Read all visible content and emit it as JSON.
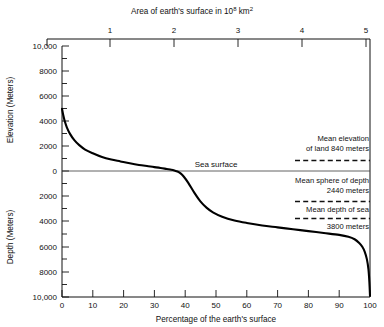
{
  "figure": {
    "caption_top": "Area of earth's surface in 10 8  km 2",
    "background": "#ffffff",
    "curve_color": "#000000"
  },
  "chart_data": {
    "type": "line",
    "title": "",
    "top_axis_label": "Area of earth's surface in 10⁸ km²",
    "top_axis_label_parts": {
      "prefix": "Area of earth's surface in 10",
      "superscript_1": "8",
      "middle": " km",
      "superscript_2": "2"
    },
    "xlabel": "Percentage of the earth's surface",
    "ylabel_upper": "Elevation (Meters)",
    "ylabel_lower": "Depth (Meters)",
    "xlim": [
      0,
      100
    ],
    "ylim": [
      -10000,
      10000
    ],
    "grid": false,
    "legend": "none",
    "x_ticks": [
      0,
      10,
      20,
      30,
      40,
      50,
      60,
      70,
      80,
      90,
      100
    ],
    "x_tick_labels": [
      "0",
      "10",
      "20",
      "30",
      "40",
      "50",
      "60",
      "70",
      "80",
      "90",
      "100"
    ],
    "top_x_ticks": [
      1,
      2,
      3,
      4,
      5
    ],
    "top_x_tick_labels": [
      "1",
      "2",
      "3",
      "4",
      "5"
    ],
    "top_xlim": [
      0,
      5.1
    ],
    "y_ticks_upper": [
      10000,
      8000,
      6000,
      4000,
      2000,
      0
    ],
    "y_tick_labels_upper": [
      "10,000",
      "8000",
      "6000",
      "4000",
      "2000",
      "0"
    ],
    "y_ticks_lower": [
      0,
      -2000,
      -4000,
      -6000,
      -8000,
      -10000
    ],
    "y_tick_labels_lower": [
      "0",
      "2000",
      "4000",
      "6000",
      "8000",
      "10,000"
    ],
    "y_minor_step": 1000,
    "series": [
      {
        "name": "Hypsographic curve",
        "x": [
          0,
          0.4,
          0.9,
          1.6,
          2.6,
          4.0,
          5.6,
          7.5,
          10.0,
          13.0,
          16.0,
          19.0,
          22.0,
          25.0,
          28.0,
          30.0,
          32.0,
          34.0,
          35.5,
          36.5,
          37.5,
          38.5,
          39.5,
          41.0,
          43.0,
          45.0,
          47.0,
          49.0,
          52.0,
          56.0,
          60.0,
          65.0,
          70.0,
          75.0,
          80.0,
          85.0,
          90.0,
          93.0,
          95.0,
          96.5,
          97.5,
          98.3,
          99.0,
          99.5,
          99.8,
          100.0
        ],
        "y": [
          5000,
          4500,
          4000,
          3500,
          3000,
          2500,
          2100,
          1750,
          1450,
          1150,
          950,
          800,
          650,
          520,
          420,
          350,
          280,
          200,
          140,
          80,
          0,
          -150,
          -400,
          -900,
          -1700,
          -2400,
          -2900,
          -3250,
          -3600,
          -3900,
          -4100,
          -4300,
          -4450,
          -4600,
          -4750,
          -4900,
          -5050,
          -5200,
          -5400,
          -5700,
          -6000,
          -6400,
          -7000,
          -7800,
          -8800,
          -9900
        ]
      }
    ],
    "reference_lines": [
      {
        "name": "sea-surface",
        "value": 0,
        "style": "solid",
        "label": "Sea surface",
        "label_x_pct": 52,
        "x_from_pct": 0,
        "x_to_pct": 100
      },
      {
        "name": "mean-elevation-of-land",
        "value": 840,
        "style": "dashed",
        "label_line1": "Mean elevation",
        "label_line2": "of land 840 meters",
        "x_from_pct": 76,
        "x_to_pct": 100
      },
      {
        "name": "mean-sphere-of-depth",
        "value": -2440,
        "style": "dashed",
        "label_line1": "Mean sphere of depth",
        "label_line2": "2440 meters",
        "x_from_pct": 76,
        "x_to_pct": 100
      },
      {
        "name": "mean-depth-of-sea",
        "value": -3800,
        "style": "dashed",
        "label_line1": "Mean depth of sea",
        "label_line2": "3800 meters",
        "x_from_pct": 76,
        "x_to_pct": 100
      }
    ],
    "annotations": [
      {
        "id": "sea-surface",
        "text": "Sea surface"
      },
      {
        "id": "mean-elevation",
        "text": "Mean elevation of land 840 meters"
      },
      {
        "id": "mean-sphere",
        "text": "Mean sphere of depth 2440 meters"
      },
      {
        "id": "mean-depth",
        "text": "Mean depth of sea 3800 meters"
      }
    ]
  },
  "labels": {
    "top_prefix": "Area of earth's surface in 10",
    "top_sup1": "8",
    "top_mid": " km",
    "top_sup2": "2",
    "xaxis": "Percentage of the earth's surface",
    "yaxis_upper": "Elevation (Meters)",
    "yaxis_lower": "Depth (Meters)",
    "sea_surface": "Sea surface",
    "mean_elev_1": "Mean elevation",
    "mean_elev_2": "of land 840 meters",
    "mean_sphere_1": "Mean sphere of depth",
    "mean_sphere_2": "2440 meters",
    "mean_depth_1": "Mean depth of sea",
    "mean_depth_2": "3800 meters",
    "y_up_10000": "10,000",
    "y_up_8000": "8000",
    "y_up_6000": "6000",
    "y_up_4000": "4000",
    "y_up_2000": "2000",
    "y_zero": "0",
    "y_dn_2000": "2000",
    "y_dn_4000": "4000",
    "y_dn_6000": "6000",
    "y_dn_8000": "8000",
    "y_dn_10000": "10,000",
    "x_0": "0",
    "x_10": "10",
    "x_20": "20",
    "x_30": "30",
    "x_40": "40",
    "x_50": "50",
    "x_60": "60",
    "x_70": "70",
    "x_80": "80",
    "x_90": "90",
    "x_100": "100",
    "top_1": "1",
    "top_2": "2",
    "top_3": "3",
    "top_4": "4",
    "top_5": "5"
  }
}
